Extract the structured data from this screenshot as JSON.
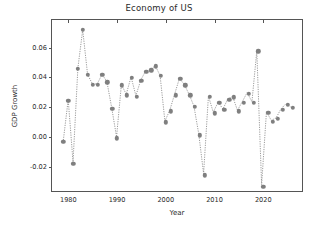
{
  "chart_data": {
    "type": "line",
    "title": "Economy of US",
    "xlabel": "Year",
    "ylabel": "GDP Growth",
    "grid": false,
    "legend": null,
    "marker": "circle",
    "linestyle": "dotted",
    "color": "#7f7f7f",
    "xlim": [
      1978.0,
      1978.0
    ],
    "ylim": [
      -0.0375,
      0.0785
    ],
    "xticks": [
      1980,
      1990,
      2000,
      2010,
      2020
    ],
    "xtick_labels": [
      "1980",
      "1990",
      "2000",
      "2010",
      "2020"
    ],
    "yticks": [
      -0.02,
      0.0,
      0.02,
      0.04,
      0.06
    ],
    "ytick_labels": [
      "-0.02",
      "0.00",
      "0.02",
      "0.04",
      "0.06"
    ],
    "x": [
      1979,
      1980,
      1981,
      1982,
      1983,
      1984,
      1985,
      1986,
      1987,
      1988,
      1989,
      1990,
      1991,
      1992,
      1993,
      1994,
      1995,
      1996,
      1997,
      1998,
      1999,
      2000,
      2001,
      2002,
      2003,
      2004,
      2005,
      2006,
      2007,
      2008,
      2009,
      2010,
      2011,
      2012,
      2013,
      2014,
      2015,
      2016,
      2017,
      2018,
      2019,
      2020,
      2021,
      2022,
      2023,
      2024,
      2025,
      2026
    ],
    "values": [
      -0.003,
      0.0245,
      -0.0178,
      0.0458,
      0.0718,
      0.0417,
      0.0351,
      0.0351,
      0.0417,
      0.0367,
      0.0189,
      -0.0008,
      0.0348,
      0.0281,
      0.0399,
      0.0272,
      0.0377,
      0.0438,
      0.0448,
      0.0475,
      0.0409,
      0.0099,
      0.0172,
      0.0281,
      0.0389,
      0.0348,
      0.0281,
      0.0201,
      0.0012,
      -0.0257,
      0.0269,
      0.0159,
      0.0228,
      0.0181,
      0.0249,
      0.0267,
      0.0172,
      0.0231,
      0.0292,
      0.0231,
      0.0575,
      -0.0332,
      0.0162,
      0.0104,
      0.0121,
      0.0182,
      0.0216,
      0.0195
    ],
    "series": [
      {
        "name": "GDP Growth",
        "values": [
          -0.003,
          0.0245,
          -0.0178,
          0.0458,
          0.0718,
          0.0417,
          0.0351,
          0.0351,
          0.0417,
          0.0367,
          0.0189,
          -0.0008,
          0.0348,
          0.0281,
          0.0399,
          0.0272,
          0.0377,
          0.0438,
          0.0448,
          0.0475,
          0.0409,
          0.0099,
          0.0172,
          0.0281,
          0.0389,
          0.0348,
          0.0281,
          0.0201,
          0.0012,
          -0.0257,
          0.0269,
          0.0159,
          0.0228,
          0.0181,
          0.0249,
          0.0267,
          0.0172,
          0.0231,
          0.0292,
          0.0231,
          0.0575,
          -0.0332,
          0.0162,
          0.0104,
          0.0121,
          0.0182,
          0.0216,
          0.0195
        ]
      }
    ]
  }
}
